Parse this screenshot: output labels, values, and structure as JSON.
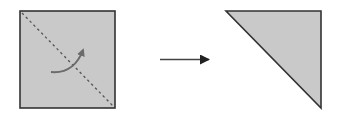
{
  "diagram": {
    "colors": {
      "paper_fill": "#c9c9c9",
      "outline": "#333333",
      "fold_line": "#555555",
      "fold_arrow": "#6b6b6b",
      "step_arrow": "#333333",
      "background": "#ffffff"
    },
    "steps": [
      {
        "name": "square-before-fold",
        "shape": "square",
        "fold": "diagonal top-left to bottom-right"
      },
      {
        "name": "triangle-after-fold",
        "shape": "right triangle"
      }
    ]
  }
}
